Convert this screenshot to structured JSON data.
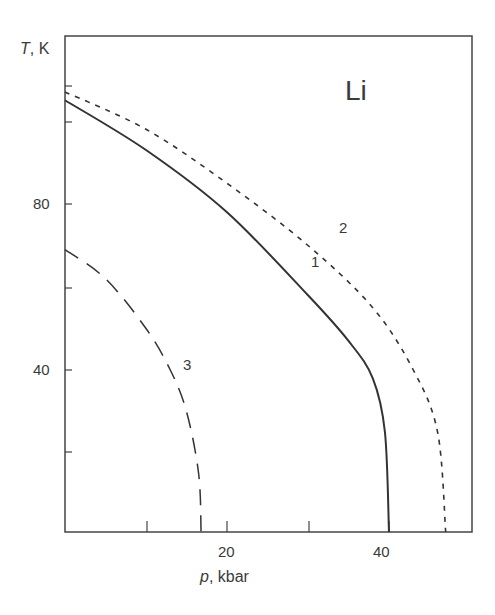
{
  "chart_data": {
    "type": "line",
    "title": "",
    "annotation": "Li",
    "xlabel": "p, kbar",
    "ylabel": "T, K",
    "xlabel_var": "p",
    "xlabel_unit": ", kbar",
    "ylabel_var": "T",
    "ylabel_unit": ", K",
    "xlim": [
      0,
      50
    ],
    "ylim": [
      0,
      115
    ],
    "x_ticks": [
      10,
      20,
      30,
      40
    ],
    "x_tick_labels": [
      "20",
      "40"
    ],
    "y_ticks": [
      20,
      40,
      60,
      80,
      100,
      108
    ],
    "y_tick_labels": [
      "40",
      "80"
    ],
    "grid": false,
    "legend": "none (curves labeled inline 1, 2, 3)",
    "series": [
      {
        "name": "1",
        "style": "solid",
        "x": [
          0,
          10,
          20,
          30,
          35,
          38,
          39.5,
          40
        ],
        "y": [
          105,
          93,
          78,
          58,
          47,
          38,
          25,
          0
        ]
      },
      {
        "name": "2",
        "style": "short-dashed",
        "x": [
          0,
          10,
          20,
          30,
          38,
          43,
          46,
          47
        ],
        "y": [
          107,
          98,
          85,
          70,
          55,
          40,
          25,
          0
        ]
      },
      {
        "name": "3",
        "style": "long-dashed",
        "x": [
          0,
          5,
          10,
          13,
          15,
          16.5,
          16.8
        ],
        "y": [
          69,
          62,
          50,
          40,
          30,
          15,
          0
        ]
      }
    ]
  },
  "labels": {
    "y_var": "T",
    "y_unit": ", K",
    "x_var": "p",
    "x_unit": ", kbar",
    "element": "Li",
    "curve1": "1",
    "curve2": "2",
    "curve3": "3",
    "ytick80": "80",
    "ytick40": "40",
    "xtick20": "20",
    "xtick40": "40"
  }
}
